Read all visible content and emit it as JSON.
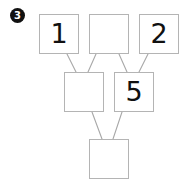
{
  "exercise": {
    "marker_label": "3",
    "marker_icon": "filled-circle-number-icon"
  },
  "diagram": {
    "type": "pyramid-tree",
    "line_color": "#a8a8a8",
    "border_color": "#b4b4b4",
    "text_color": "#111111",
    "nodes": [
      {
        "id": "top-left",
        "value": "1",
        "row": "top",
        "col": 0
      },
      {
        "id": "top-middle",
        "value": "",
        "row": "top",
        "col": 1
      },
      {
        "id": "top-right",
        "value": "2",
        "row": "top",
        "col": 2
      },
      {
        "id": "middle-left",
        "value": "",
        "row": "middle",
        "col": 0
      },
      {
        "id": "middle-right",
        "value": "5",
        "row": "middle",
        "col": 1
      },
      {
        "id": "bottom",
        "value": "",
        "row": "bottom",
        "col": 0
      }
    ],
    "edges": [
      {
        "from": "top-left",
        "to": "middle-left"
      },
      {
        "from": "top-middle",
        "to": "middle-left"
      },
      {
        "from": "top-middle",
        "to": "middle-right"
      },
      {
        "from": "top-right",
        "to": "middle-right"
      },
      {
        "from": "middle-left",
        "to": "bottom"
      },
      {
        "from": "middle-right",
        "to": "bottom"
      }
    ]
  }
}
